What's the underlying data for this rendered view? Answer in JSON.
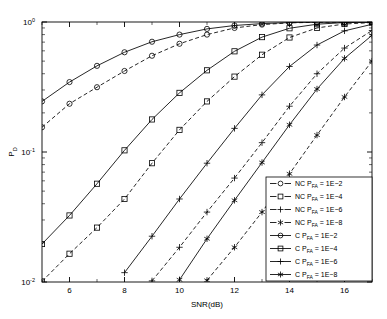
{
  "chart_data": {
    "type": "line",
    "title": "",
    "xlabel": "SNR(dB)",
    "ylabel": "P_D",
    "ylabel_base": "P",
    "ylabel_sub": "D",
    "xlim": [
      5,
      17
    ],
    "ylim": [
      0.01,
      1.0
    ],
    "yscale": "log",
    "xscale": "linear",
    "grid": false,
    "box": true,
    "xticks": [
      6,
      8,
      10,
      12,
      14,
      16
    ],
    "xticklabels": [
      "6",
      "8",
      "10",
      "12",
      "14",
      "16"
    ],
    "yticks": [
      1,
      0.1,
      0.01
    ],
    "yticklabels": [
      "10^0",
      "10^-1",
      "10^-2"
    ],
    "ytick_mantissa": [
      "10",
      "10",
      "10"
    ],
    "ytick_exponent": [
      "0",
      "-1",
      "-2"
    ],
    "legend_position": "lower right",
    "x": [
      5,
      6,
      7,
      8,
      9,
      10,
      11,
      12,
      13,
      14,
      15,
      16,
      17
    ],
    "series": [
      {
        "name": "NC P_FA = 1E-2",
        "label_prefix": "NC P",
        "label_sub": "FA",
        "label_value": "= 1E-2",
        "linestyle": "dashed",
        "marker": "circle",
        "values": [
          0.155,
          0.235,
          0.315,
          0.42,
          0.55,
          0.68,
          0.8,
          0.9,
          0.955,
          0.985,
          0.995,
          0.999,
          1.0
        ]
      },
      {
        "name": "NC P_FA = 1E-4",
        "label_prefix": "NC P",
        "label_sub": "FA",
        "label_value": "= 1E-4",
        "linestyle": "dashed",
        "marker": "square",
        "values": [
          0.0101,
          0.0165,
          0.0262,
          0.0435,
          0.082,
          0.148,
          0.245,
          0.38,
          0.56,
          0.76,
          0.9,
          0.965,
          0.99
        ]
      },
      {
        "name": "NC P_FA = 1E-6",
        "label_prefix": "NC P",
        "label_sub": "FA",
        "label_value": "= 1E-6",
        "linestyle": "dashed",
        "marker": "plus",
        "values": [
          null,
          null,
          null,
          null,
          0.0102,
          0.0185,
          0.0345,
          0.063,
          0.118,
          0.225,
          0.4,
          0.63,
          0.86
        ]
      },
      {
        "name": "NC P_FA = 1E-8",
        "label_prefix": "NC P",
        "label_sub": "FA",
        "label_value": "= 1E-8",
        "linestyle": "dashed",
        "marker": "star",
        "values": [
          null,
          null,
          null,
          null,
          null,
          null,
          0.0103,
          0.0185,
          0.0345,
          0.068,
          0.135,
          0.265,
          0.5
        ]
      },
      {
        "name": "C P_FA = 1E-2",
        "label_prefix": "C P",
        "label_sub": "FA",
        "label_value": "= 1E-2",
        "linestyle": "solid",
        "marker": "circle",
        "values": [
          0.245,
          0.345,
          0.46,
          0.585,
          0.705,
          0.8,
          0.885,
          0.94,
          0.972,
          0.99,
          0.997,
          0.999,
          1.0
        ]
      },
      {
        "name": "C P_FA = 1E-4",
        "label_prefix": "C P",
        "label_sub": "FA",
        "label_value": "= 1E-4",
        "linestyle": "solid",
        "marker": "square",
        "values": [
          0.0196,
          0.0325,
          0.057,
          0.103,
          0.178,
          0.285,
          0.425,
          0.595,
          0.765,
          0.895,
          0.962,
          0.99,
          0.998
        ]
      },
      {
        "name": "C P_FA = 1E-6",
        "label_prefix": "C P",
        "label_sub": "FA",
        "label_value": "= 1E-6",
        "linestyle": "solid",
        "marker": "plus",
        "values": [
          null,
          null,
          null,
          0.0118,
          0.0225,
          0.0435,
          0.082,
          0.152,
          0.275,
          0.455,
          0.665,
          0.855,
          0.96
        ]
      },
      {
        "name": "C P_FA = 1E-8",
        "label_prefix": "C P",
        "label_sub": "FA",
        "label_value": "= 1E-8",
        "linestyle": "solid",
        "marker": "star",
        "values": [
          null,
          null,
          null,
          null,
          null,
          0.0104,
          0.0215,
          0.0425,
          0.083,
          0.162,
          0.305,
          0.525,
          0.79
        ]
      }
    ]
  },
  "legend": {
    "entries": [
      {
        "prefix": "NC P",
        "sub": "FA",
        "value": "= 1E−2",
        "style": "dashed",
        "marker": "circle"
      },
      {
        "prefix": "NC P",
        "sub": "FA",
        "value": "= 1E−4",
        "style": "dashed",
        "marker": "square"
      },
      {
        "prefix": "NC P",
        "sub": "FA",
        "value": "= 1E−6",
        "style": "dashed",
        "marker": "plus"
      },
      {
        "prefix": "NC P",
        "sub": "FA",
        "value": "= 1E−8",
        "style": "dashed",
        "marker": "star"
      },
      {
        "prefix": "C P",
        "sub": "FA",
        "value": "= 1E−2",
        "style": "solid",
        "marker": "circle"
      },
      {
        "prefix": "C P",
        "sub": "FA",
        "value": "= 1E−4",
        "style": "solid",
        "marker": "square"
      },
      {
        "prefix": "C P",
        "sub": "FA",
        "value": "= 1E−6",
        "style": "solid",
        "marker": "plus"
      },
      {
        "prefix": "C P",
        "sub": "FA",
        "value": "= 1E−8",
        "style": "solid",
        "marker": "star"
      }
    ]
  },
  "colors": {
    "axis": "#000000",
    "line": "#000000",
    "background": "#ffffff"
  }
}
